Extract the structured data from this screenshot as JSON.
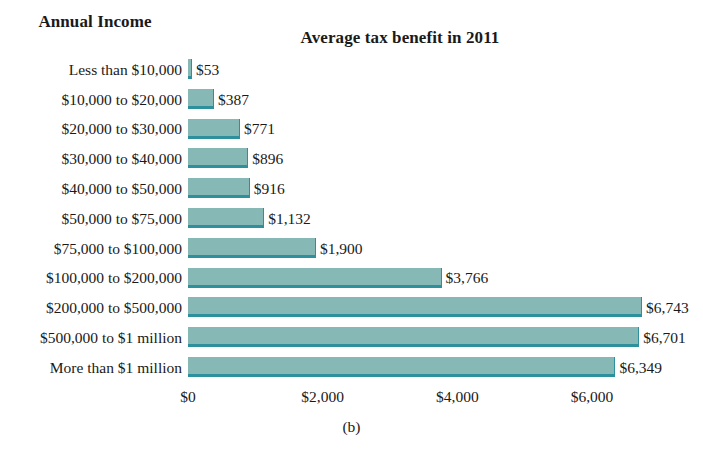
{
  "figure": {
    "caption": "(b)",
    "column_header": "Annual Income",
    "title": "Average tax benefit in 2011"
  },
  "colors": {
    "bar_fill": "#86b8b5",
    "bar_edge": "#2e8f9d",
    "background": "#ffffff",
    "text": "#1a1a1a"
  },
  "chart_data": {
    "type": "bar",
    "orientation": "horizontal",
    "title": "Average tax benefit in 2011",
    "xlabel": "",
    "ylabel": "Annual Income",
    "xlim": [
      0,
      7000
    ],
    "grid": false,
    "legend": null,
    "xticks": [
      "$0",
      "$2,000",
      "$4,000",
      "$6,000"
    ],
    "xtick_values": [
      0,
      2000,
      4000,
      6000
    ],
    "categories": [
      "Less than $10,000",
      "$10,000 to $20,000",
      "$20,000 to $30,000",
      "$30,000 to $40,000",
      "$40,000 to $50,000",
      "$50,000 to $75,000",
      "$75,000 to $100,000",
      "$100,000 to $200,000",
      "$200,000 to $500,000",
      "$500,000 to $1 million",
      "More than $1 million"
    ],
    "values": [
      53,
      387,
      771,
      896,
      916,
      1132,
      1900,
      3766,
      6743,
      6701,
      6349
    ],
    "data_labels": [
      "$53",
      "$387",
      "$771",
      "$896",
      "$916",
      "$1,132",
      "$1,900",
      "$3,766",
      "$6,743",
      "$6,701",
      "$6,349"
    ]
  }
}
